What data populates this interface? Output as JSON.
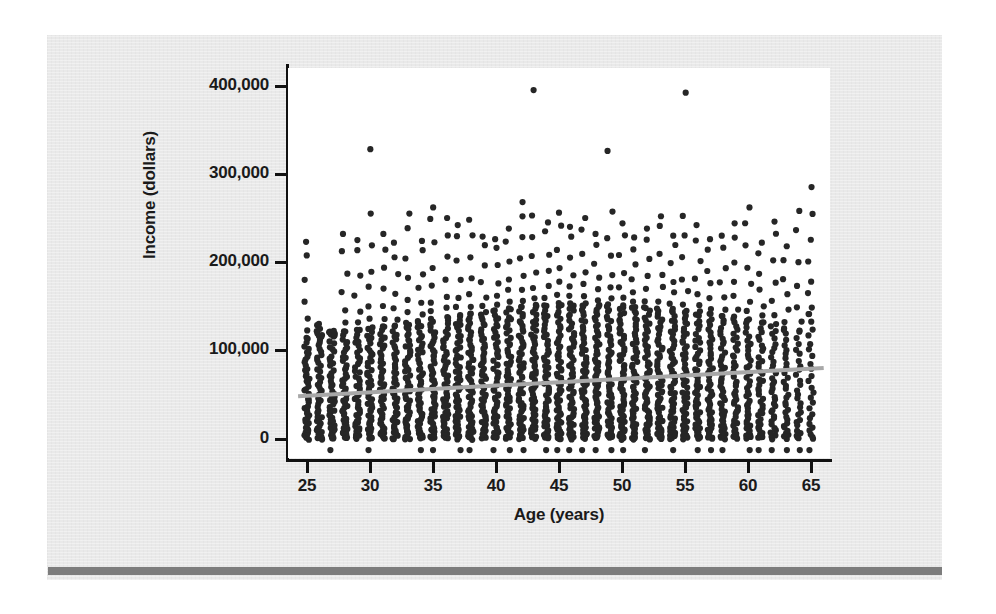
{
  "slide": {
    "background_color": "#ffffff",
    "panel_color": "#e9e9e9",
    "rule_color": "#7d7d7d"
  },
  "chart_data": {
    "type": "scatter",
    "title": "",
    "xlabel": "Age (years)",
    "ylabel": "Income (dollars)",
    "xlim": [
      23.5,
      66.5
    ],
    "ylim": [
      -22000,
      420000
    ],
    "xticks": [
      25,
      30,
      35,
      40,
      45,
      50,
      55,
      60,
      65
    ],
    "xticklabels": [
      "25",
      "30",
      "35",
      "40",
      "45",
      "50",
      "55",
      "60",
      "65"
    ],
    "yticks": [
      0,
      100000,
      200000,
      300000,
      400000
    ],
    "yticklabels": [
      "0",
      "100,000",
      "200,000",
      "300,000",
      "400,000"
    ],
    "grid": false,
    "legend": false,
    "marker_color": "#262626",
    "marker_size": 4,
    "trendline": {
      "color": "#a8a8a8",
      "width": 4,
      "x": [
        24.3,
        66.0
      ],
      "y": [
        48000,
        80000
      ],
      "slope_per_year": 770,
      "intercept": 29300
    },
    "series": [
      {
        "name": "Individuals",
        "description": "Income vs age; dense band of points from $0 to about $150,000 at every integer age from 25 to 65, with a thinning scatter of outliers reaching $395,000.",
        "points_by_age": [
          {
            "age": 25,
            "count": 46,
            "max": 223000,
            "bulk_max": 112000
          },
          {
            "age": 26,
            "count": 44,
            "max": 130000,
            "bulk_max": 116000
          },
          {
            "age": 27,
            "count": 47,
            "max": 122000,
            "bulk_max": 118000
          },
          {
            "age": 28,
            "count": 48,
            "max": 232000,
            "bulk_max": 120000
          },
          {
            "age": 29,
            "count": 46,
            "max": 225000,
            "bulk_max": 122000
          },
          {
            "age": 30,
            "count": 50,
            "max": 328000,
            "bulk_max": 124000
          },
          {
            "age": 31,
            "count": 47,
            "max": 232000,
            "bulk_max": 126000
          },
          {
            "age": 32,
            "count": 49,
            "max": 222000,
            "bulk_max": 126000
          },
          {
            "age": 33,
            "count": 52,
            "max": 255000,
            "bulk_max": 130000
          },
          {
            "age": 34,
            "count": 50,
            "max": 224000,
            "bulk_max": 132000
          },
          {
            "age": 35,
            "count": 54,
            "max": 262000,
            "bulk_max": 134000
          },
          {
            "age": 36,
            "count": 53,
            "max": 250000,
            "bulk_max": 136000
          },
          {
            "age": 37,
            "count": 55,
            "max": 242000,
            "bulk_max": 138000
          },
          {
            "age": 38,
            "count": 56,
            "max": 248000,
            "bulk_max": 140000
          },
          {
            "age": 39,
            "count": 55,
            "max": 229000,
            "bulk_max": 142000
          },
          {
            "age": 40,
            "count": 57,
            "max": 226000,
            "bulk_max": 144000
          },
          {
            "age": 41,
            "count": 56,
            "max": 238000,
            "bulk_max": 146000
          },
          {
            "age": 42,
            "count": 58,
            "max": 268000,
            "bulk_max": 148000
          },
          {
            "age": 43,
            "count": 58,
            "max": 395000,
            "bulk_max": 150000
          },
          {
            "age": 44,
            "count": 57,
            "max": 245000,
            "bulk_max": 150000
          },
          {
            "age": 45,
            "count": 59,
            "max": 256000,
            "bulk_max": 152000
          },
          {
            "age": 46,
            "count": 58,
            "max": 240000,
            "bulk_max": 152000
          },
          {
            "age": 47,
            "count": 60,
            "max": 250000,
            "bulk_max": 152000
          },
          {
            "age": 48,
            "count": 59,
            "max": 232000,
            "bulk_max": 150000
          },
          {
            "age": 49,
            "count": 57,
            "max": 326000,
            "bulk_max": 150000
          },
          {
            "age": 50,
            "count": 58,
            "max": 244000,
            "bulk_max": 150000
          },
          {
            "age": 51,
            "count": 56,
            "max": 228000,
            "bulk_max": 148000
          },
          {
            "age": 52,
            "count": 57,
            "max": 238000,
            "bulk_max": 148000
          },
          {
            "age": 53,
            "count": 55,
            "max": 252000,
            "bulk_max": 146000
          },
          {
            "age": 54,
            "count": 54,
            "max": 230000,
            "bulk_max": 146000
          },
          {
            "age": 55,
            "count": 53,
            "max": 392000,
            "bulk_max": 144000
          },
          {
            "age": 56,
            "count": 50,
            "max": 242000,
            "bulk_max": 142000
          },
          {
            "age": 57,
            "count": 48,
            "max": 226000,
            "bulk_max": 140000
          },
          {
            "age": 58,
            "count": 46,
            "max": 230000,
            "bulk_max": 138000
          },
          {
            "age": 59,
            "count": 44,
            "max": 244000,
            "bulk_max": 136000
          },
          {
            "age": 60,
            "count": 42,
            "max": 262000,
            "bulk_max": 134000
          },
          {
            "age": 61,
            "count": 38,
            "max": 222000,
            "bulk_max": 130000
          },
          {
            "age": 62,
            "count": 34,
            "max": 246000,
            "bulk_max": 128000
          },
          {
            "age": 63,
            "count": 30,
            "max": 218000,
            "bulk_max": 124000
          },
          {
            "age": 64,
            "count": 26,
            "max": 258000,
            "bulk_max": 120000
          },
          {
            "age": 65,
            "count": 24,
            "max": 285000,
            "bulk_max": 140000
          }
        ]
      }
    ]
  }
}
